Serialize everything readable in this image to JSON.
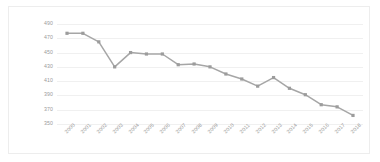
{
  "chart_data": {
    "type": "line",
    "title": "",
    "subtitle": "",
    "xlabel": "",
    "ylabel": "",
    "categories": [
      "2000",
      "2001",
      "2002",
      "2003",
      "2004",
      "2005",
      "2006",
      "2007",
      "2008",
      "2009",
      "2010",
      "2011",
      "2012",
      "2013",
      "2014",
      "2015",
      "2016",
      "2017",
      "2018"
    ],
    "values": [
      477,
      477,
      465,
      430,
      450,
      448,
      448,
      433,
      434,
      430,
      420,
      413,
      403,
      415,
      400,
      391,
      377,
      374,
      362
    ],
    "series": [
      {
        "name": "series-1",
        "values": [
          477,
          477,
          465,
          430,
          450,
          448,
          448,
          433,
          434,
          430,
          420,
          413,
          403,
          415,
          400,
          391,
          377,
          374,
          362
        ]
      }
    ],
    "ylim": [
      350,
      490
    ],
    "yticks": [
      490,
      470,
      450,
      430,
      410,
      390,
      370,
      350
    ],
    "ytick_labels": [
      "490",
      "470",
      "450",
      "430",
      "410",
      "390",
      "370",
      "350"
    ],
    "xtick_labels": [
      "2000",
      "2001",
      "2002",
      "2003",
      "2004",
      "2005",
      "2006",
      "2007",
      "2008",
      "2009",
      "2010",
      "2011",
      "2012",
      "2013",
      "2014",
      "2015",
      "2016",
      "2017",
      "2018"
    ],
    "grid": true,
    "legend": false,
    "legend_position": "none",
    "marker": "square",
    "line_color": "#a6a6a6",
    "marker_color": "#9c9c9c",
    "grid_color": "#f0f0f0",
    "tick_label_color": "#9a9a9a",
    "background_color": "#ffffff",
    "border_color": "#ededed"
  }
}
